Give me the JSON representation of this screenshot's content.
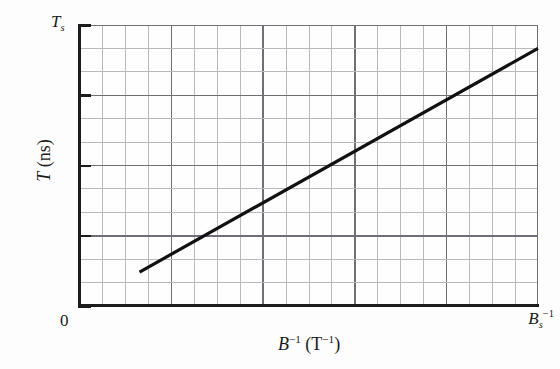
{
  "chart_data": {
    "type": "line",
    "title": "",
    "subtitle": "",
    "xlabel_parts": {
      "symbol": "B",
      "exponent": "−1",
      "unit_open": "(T",
      "unit_exponent": "−1",
      "unit_close": ")"
    },
    "ylabel_parts": {
      "symbol": "T",
      "unit": "(ns)"
    },
    "xlabel": "B⁻¹ (T⁻¹)",
    "ylabel": "T (ns)",
    "x_tick_labels": [
      "0",
      "Bₛ⁻¹"
    ],
    "y_tick_labels": [
      "Tₛ"
    ],
    "x_origin_label": "0",
    "x_max_label_symbol": "B",
    "x_max_label_sub": "s",
    "x_max_label_sup": "−1",
    "y_max_label_symbol": "T",
    "y_max_label_sub": "s",
    "xlim": [
      0,
      20
    ],
    "ylim": [
      0,
      12
    ],
    "grid": true,
    "grid_minor_cols": 20,
    "grid_minor_rows": 12,
    "grid_major_every_col": 4,
    "grid_major_every_row": 3,
    "legend": "none",
    "series": [
      {
        "name": "T vs inverse B",
        "x": [
          2.6,
          20.0
        ],
        "y": [
          1.45,
          11.0
        ],
        "line_color": "#111111",
        "line_width": 3.2,
        "description": "straight line of positive slope from lower-left to upper-right corner"
      }
    ],
    "colors": {
      "background": "#fdfdfd",
      "axis": "#1c1c1c",
      "grid_minor": "#b9b9bd",
      "grid_major": "#6f7076",
      "line": "#111111",
      "text": "#1a1a1a"
    },
    "annotations": []
  }
}
